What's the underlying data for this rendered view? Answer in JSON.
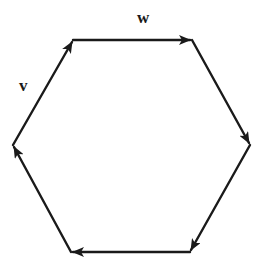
{
  "diagram": {
    "type": "hexagon-vector-cycle",
    "color": "#1a1a1a",
    "vertices": [
      {
        "id": "top-left",
        "x": 73,
        "y": 40
      },
      {
        "id": "top-right",
        "x": 192,
        "y": 40
      },
      {
        "id": "right",
        "x": 250,
        "y": 145
      },
      {
        "id": "bottom-right",
        "x": 190,
        "y": 252
      },
      {
        "id": "bottom-left",
        "x": 71,
        "y": 252
      },
      {
        "id": "left",
        "x": 13,
        "y": 145
      }
    ],
    "edges": [
      {
        "from": "top-left",
        "to": "top-right",
        "label": "w"
      },
      {
        "from": "top-right",
        "to": "right",
        "label": ""
      },
      {
        "from": "right",
        "to": "bottom-right",
        "label": ""
      },
      {
        "from": "bottom-right",
        "to": "bottom-left",
        "label": ""
      },
      {
        "from": "bottom-left",
        "to": "left",
        "label": ""
      },
      {
        "from": "left",
        "to": "top-left",
        "label": "v"
      }
    ],
    "labels": {
      "w": "w",
      "v": "v"
    }
  }
}
